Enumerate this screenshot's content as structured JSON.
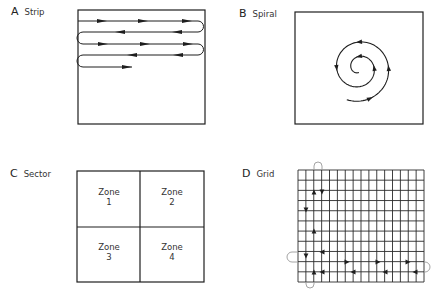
{
  "figure": {
    "panels": [
      {
        "id": "A",
        "letter": "A",
        "name": "Strip",
        "box": [
          78,
          10,
          205,
          124
        ],
        "label_pos": [
          11,
          7
        ],
        "strip_rows_y": [
          21,
          32,
          44,
          55,
          67
        ],
        "strip_left_x": 78,
        "strip_right_x": 203,
        "strip_last_end_x": 132,
        "arrows": [
          {
            "row": 0,
            "x": 102,
            "dir": "right"
          },
          {
            "row": 0,
            "x": 143,
            "dir": "right"
          },
          {
            "row": 0,
            "x": 187,
            "dir": "right"
          },
          {
            "row": 1,
            "x": 120,
            "dir": "left"
          },
          {
            "row": 1,
            "x": 177,
            "dir": "left"
          },
          {
            "row": 2,
            "x": 103,
            "dir": "right"
          },
          {
            "row": 2,
            "x": 145,
            "dir": "right"
          },
          {
            "row": 2,
            "x": 188,
            "dir": "right"
          },
          {
            "row": 3,
            "x": 132,
            "dir": "left"
          },
          {
            "row": 3,
            "x": 178,
            "dir": "left"
          },
          {
            "row": 4,
            "x": 127,
            "dir": "right"
          }
        ]
      },
      {
        "id": "B",
        "letter": "B",
        "name": "Spiral",
        "box": [
          295,
          12,
          423,
          124
        ],
        "label_pos": [
          239,
          9
        ],
        "spiral": {
          "cx": 359,
          "cy": 68,
          "start_deg": 249,
          "end_deg": 990,
          "r_start": 34,
          "r_per_deg": 0.04
        },
        "arrow_angles_deg": [
          290,
          360,
          450,
          540,
          720,
          810
        ]
      },
      {
        "id": "C",
        "letter": "C",
        "name": "Sector",
        "box": [
          77,
          171,
          204,
          282
        ],
        "label_pos": [
          10,
          169
        ],
        "divider_x": 140,
        "divider_y": 227,
        "zones": [
          {
            "word": "Zone",
            "number": "1",
            "cx": 109,
            "y": 187
          },
          {
            "word": "Zone",
            "number": "2",
            "cx": 172,
            "y": 187
          },
          {
            "word": "Zone",
            "number": "3",
            "cx": 109,
            "y": 242
          },
          {
            "word": "Zone",
            "number": "4",
            "cx": 172,
            "y": 242
          }
        ]
      },
      {
        "id": "D",
        "letter": "D",
        "name": "Grid",
        "box": [
          298,
          170,
          424,
          282
        ],
        "label_pos": [
          242,
          169
        ],
        "grid_cols": 16,
        "grid_rows": 11,
        "vertical_sweeps_x": [
          306,
          314,
          322
        ],
        "horizontal_sweeps_y": [
          252,
          262,
          272
        ],
        "loops": [
          {
            "side": "bottom",
            "a": 306,
            "b": 314,
            "depth": 288
          },
          {
            "side": "top",
            "a": 314,
            "b": 322,
            "depth": 162
          },
          {
            "side": "left",
            "a": 252,
            "b": 262,
            "depth": 288
          },
          {
            "side": "right",
            "a": 262,
            "b": 272,
            "depth": 430
          }
        ],
        "markers": [
          {
            "x": 306,
            "y": 210,
            "dir": "down"
          },
          {
            "x": 306,
            "y": 256,
            "dir": "down"
          },
          {
            "x": 314,
            "y": 192,
            "dir": "up"
          },
          {
            "x": 314,
            "y": 231,
            "dir": "up"
          },
          {
            "x": 314,
            "y": 272,
            "dir": "up"
          },
          {
            "x": 322,
            "y": 192,
            "dir": "down"
          },
          {
            "x": 322,
            "y": 252,
            "dir": "left"
          },
          {
            "x": 347,
            "y": 262,
            "dir": "right"
          },
          {
            "x": 378,
            "y": 262,
            "dir": "right"
          },
          {
            "x": 408,
            "y": 262,
            "dir": "right"
          },
          {
            "x": 415,
            "y": 272,
            "dir": "left"
          },
          {
            "x": 385,
            "y": 272,
            "dir": "left"
          },
          {
            "x": 353,
            "y": 272,
            "dir": "left"
          },
          {
            "x": 322,
            "y": 272,
            "dir": "left"
          }
        ]
      }
    ],
    "colors": {
      "ink": "#1e1e1e",
      "loop": "#9a9a9a",
      "grid": "#2a2a2a"
    }
  }
}
